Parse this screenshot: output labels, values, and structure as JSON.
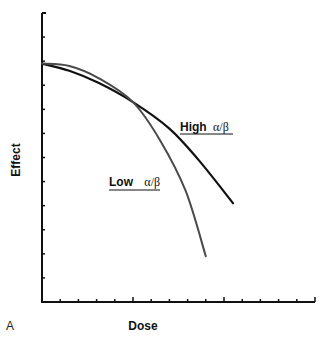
{
  "figure": {
    "panel_label": "A",
    "xlabel": "Dose",
    "ylabel": "Effect"
  },
  "colors": {
    "axis": "#111111",
    "high_curve": "#111111",
    "low_curve": "#4a4a4a",
    "background": "#ffffff"
  },
  "chart_data": {
    "type": "line",
    "title": "",
    "xlabel": "Dose",
    "ylabel": "Effect",
    "panel_label": "A",
    "grid": false,
    "legend_position": "inline labels",
    "xlim": [
      0,
      15
    ],
    "ylim": [
      0,
      12
    ],
    "x_ticks": [
      0,
      1,
      2,
      3,
      4,
      5,
      6,
      7,
      8,
      9,
      10,
      11,
      12,
      13,
      14,
      15
    ],
    "x_major_ticks": [
      5,
      10,
      15
    ],
    "y_ticks": [
      0,
      1,
      2,
      3,
      4,
      5,
      6,
      7,
      8,
      9,
      10,
      11,
      12
    ],
    "tick_labels_shown": false,
    "series": [
      {
        "name": "High α/β",
        "label_prefix": "High",
        "label_greek": "α/β",
        "color": "#111111",
        "x": [
          0,
          1.5,
          3.1,
          5.0,
          7.0,
          8.6,
          10.5
        ],
        "y": [
          9.9,
          9.6,
          9.1,
          8.3,
          7.2,
          5.9,
          4.1
        ]
      },
      {
        "name": "Low α/β",
        "label_prefix": "Low",
        "label_greek": "α/β",
        "color": "#4a4a4a",
        "x": [
          0,
          1.5,
          3.1,
          5.0,
          6.5,
          7.9,
          9.0
        ],
        "y": [
          9.9,
          9.8,
          9.3,
          8.3,
          6.7,
          4.6,
          1.9
        ]
      }
    ]
  }
}
